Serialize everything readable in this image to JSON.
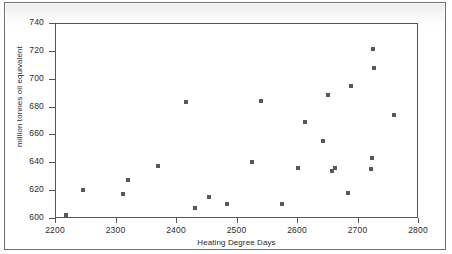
{
  "figure": {
    "name": "heating-degree-days-scatter"
  },
  "chart_data": {
    "type": "scatter",
    "title": "",
    "xlabel": "Heating Degree Days",
    "ylabel": "million tonnes oil equivalent",
    "xlim": [
      2200,
      2800
    ],
    "ylim": [
      600,
      740
    ],
    "xticks": [
      2200,
      2300,
      2400,
      2500,
      2600,
      2700,
      2800
    ],
    "yticks": [
      600,
      620,
      640,
      660,
      680,
      700,
      720,
      740
    ],
    "grid": false,
    "legend": null,
    "marker": {
      "shape": "square",
      "color": "#585858",
      "size_px": 4
    },
    "points": [
      {
        "x": 2218,
        "y": 602
      },
      {
        "x": 2247,
        "y": 620
      },
      {
        "x": 2312,
        "y": 617
      },
      {
        "x": 2320,
        "y": 627
      },
      {
        "x": 2371,
        "y": 637
      },
      {
        "x": 2417,
        "y": 683
      },
      {
        "x": 2431,
        "y": 607
      },
      {
        "x": 2455,
        "y": 615
      },
      {
        "x": 2484,
        "y": 610
      },
      {
        "x": 2526,
        "y": 640
      },
      {
        "x": 2540,
        "y": 684
      },
      {
        "x": 2576,
        "y": 610
      },
      {
        "x": 2602,
        "y": 636
      },
      {
        "x": 2613,
        "y": 669
      },
      {
        "x": 2643,
        "y": 655
      },
      {
        "x": 2652,
        "y": 688
      },
      {
        "x": 2658,
        "y": 634
      },
      {
        "x": 2662,
        "y": 636
      },
      {
        "x": 2685,
        "y": 618
      },
      {
        "x": 2690,
        "y": 695
      },
      {
        "x": 2722,
        "y": 635
      },
      {
        "x": 2724,
        "y": 643
      },
      {
        "x": 2726,
        "y": 721
      },
      {
        "x": 2728,
        "y": 708
      },
      {
        "x": 2760,
        "y": 674
      }
    ]
  }
}
